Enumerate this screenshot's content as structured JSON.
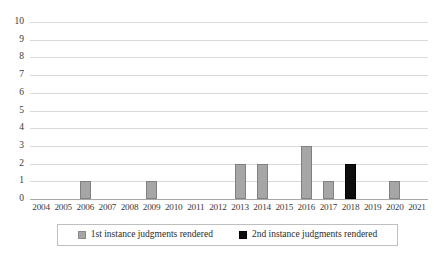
{
  "chart_data": {
    "type": "bar",
    "title": "",
    "subtitle": "",
    "xlabel": "",
    "ylabel": "",
    "categories": [
      "2004",
      "2005",
      "2006",
      "2007",
      "2008",
      "2009",
      "2010",
      "2011",
      "2012",
      "2013",
      "2014",
      "2015",
      "2016",
      "2017",
      "2018",
      "2019",
      "2020",
      "2021"
    ],
    "series": [
      {
        "name": "1st instance judgments rendered",
        "color": "#a6a6a6",
        "values": [
          0,
          0,
          1,
          0,
          0,
          1,
          0,
          0,
          0,
          2,
          2,
          0,
          3,
          1,
          0,
          0,
          1,
          0
        ]
      },
      {
        "name": "2nd instance judgments rendered",
        "color": "#0d0d0d",
        "values": [
          0,
          0,
          0,
          0,
          0,
          0,
          0,
          0,
          0,
          0,
          0,
          0,
          0,
          0,
          2,
          0,
          0,
          0
        ]
      }
    ],
    "ylim": [
      0,
      10
    ],
    "yticks": [
      "0",
      "1",
      "2",
      "3",
      "4",
      "5",
      "6",
      "7",
      "8",
      "9",
      "10"
    ],
    "grid": true,
    "legend_position": "bottom"
  },
  "legend": {
    "entries": [
      {
        "label": "1st instance judgments rendered",
        "swatch": "gray-square-swatch"
      },
      {
        "label": "2nd instance judgments rendered",
        "swatch": "black-square-swatch"
      }
    ]
  }
}
